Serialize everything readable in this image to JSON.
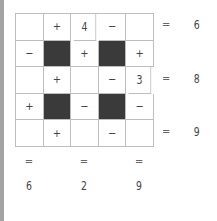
{
  "puzzle": {
    "grid": [
      [
        {
          "t": "blank",
          "v": ""
        },
        {
          "t": "op",
          "v": "+"
        },
        {
          "t": "num",
          "v": "4"
        },
        {
          "t": "op",
          "v": "−"
        },
        {
          "t": "blank",
          "v": ""
        }
      ],
      [
        {
          "t": "op",
          "v": "−"
        },
        {
          "t": "dark",
          "v": ""
        },
        {
          "t": "op",
          "v": "+"
        },
        {
          "t": "dark",
          "v": ""
        },
        {
          "t": "op",
          "v": "+"
        }
      ],
      [
        {
          "t": "blank",
          "v": ""
        },
        {
          "t": "op",
          "v": "+"
        },
        {
          "t": "blank",
          "v": ""
        },
        {
          "t": "op",
          "v": "−"
        },
        {
          "t": "num",
          "v": "3"
        }
      ],
      [
        {
          "t": "op",
          "v": "+"
        },
        {
          "t": "dark",
          "v": ""
        },
        {
          "t": "op",
          "v": "−"
        },
        {
          "t": "dark",
          "v": ""
        },
        {
          "t": "op",
          "v": "−"
        }
      ],
      [
        {
          "t": "blank",
          "v": ""
        },
        {
          "t": "op",
          "v": "+"
        },
        {
          "t": "blank",
          "v": ""
        },
        {
          "t": "op",
          "v": "−"
        },
        {
          "t": "blank",
          "v": ""
        }
      ]
    ],
    "row_results": [
      {
        "row": 0,
        "eq": "=",
        "value": "6"
      },
      {
        "row": 2,
        "eq": "=",
        "value": "8"
      },
      {
        "row": 4,
        "eq": "=",
        "value": "9"
      }
    ],
    "col_results": [
      {
        "col": 0,
        "eq": "=",
        "value": "6"
      },
      {
        "col": 2,
        "eq": "=",
        "value": "2"
      },
      {
        "col": 4,
        "eq": "=",
        "value": "9"
      }
    ]
  }
}
